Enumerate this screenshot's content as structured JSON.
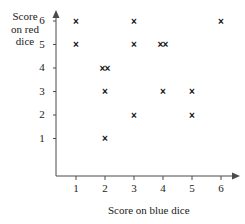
{
  "chart_data": {
    "type": "scatter",
    "title": "",
    "xlabel": "Score on blue dice",
    "ylabel": "Score on red dice",
    "xlim": [
      0,
      6.6
    ],
    "ylim": [
      0,
      6.6
    ],
    "xticks": [
      "1",
      "2",
      "3",
      "4",
      "5",
      "6"
    ],
    "yticks": [
      "1",
      "2",
      "3",
      "4",
      "5",
      "6"
    ],
    "grid": false,
    "legend": false,
    "marker": "x",
    "marker_color": "#111111",
    "axis_color": "#4a4a4a",
    "points": [
      {
        "x": 1,
        "y": 6,
        "count": 1
      },
      {
        "x": 3,
        "y": 6,
        "count": 1
      },
      {
        "x": 6,
        "y": 6,
        "count": 1
      },
      {
        "x": 1,
        "y": 5,
        "count": 1
      },
      {
        "x": 3,
        "y": 5,
        "count": 1
      },
      {
        "x": 4,
        "y": 5,
        "count": 2
      },
      {
        "x": 2,
        "y": 4,
        "count": 2
      },
      {
        "x": 2,
        "y": 3,
        "count": 1
      },
      {
        "x": 4,
        "y": 3,
        "count": 1
      },
      {
        "x": 5,
        "y": 3,
        "count": 1
      },
      {
        "x": 3,
        "y": 2,
        "count": 1
      },
      {
        "x": 5,
        "y": 2,
        "count": 1
      },
      {
        "x": 2,
        "y": 1,
        "count": 1
      }
    ]
  },
  "axis_titles": {
    "y_line1": "Score",
    "y_line2": "on red",
    "y_line3": "dice",
    "x": "Score on blue dice"
  }
}
